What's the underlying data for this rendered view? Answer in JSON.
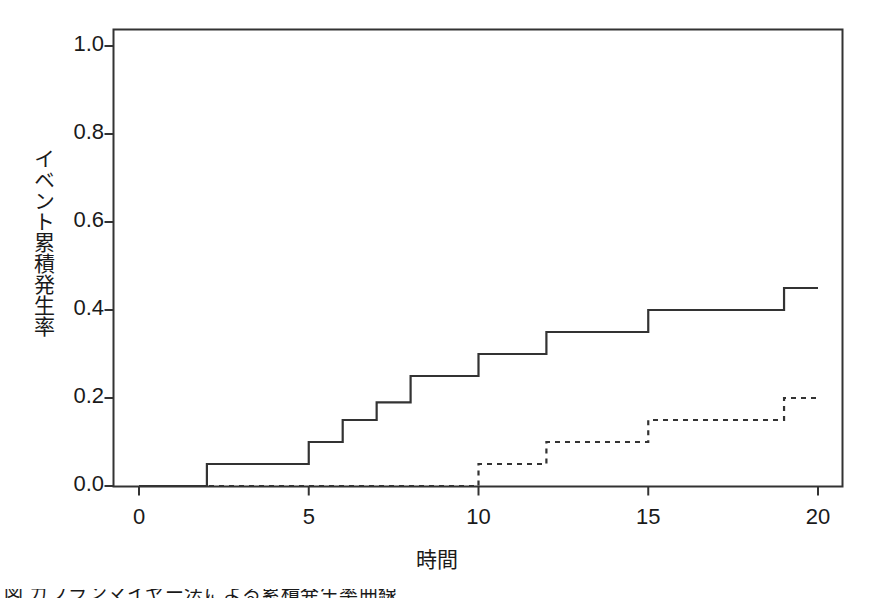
{
  "chart_data": {
    "type": "line",
    "title": "",
    "subtitle": "",
    "xlabel": "時間",
    "ylabel": "イベント累積発生率",
    "xlim": [
      0,
      20
    ],
    "ylim": [
      0.0,
      1.04
    ],
    "xticks": [
      "0",
      "5",
      "10",
      "15",
      "20"
    ],
    "xtick_values": [
      0,
      5,
      10,
      15,
      20
    ],
    "yticks": [
      "0.0",
      "0.2",
      "0.4",
      "0.6",
      "0.8",
      "1.0"
    ],
    "ytick_values": [
      0.0,
      0.2,
      0.4,
      0.6,
      0.8,
      1.0
    ],
    "grid": false,
    "legend": "none",
    "step_direction": "post",
    "line_color": "#333333",
    "background": "#ffffff",
    "series": [
      {
        "name": "solid-curve",
        "style": "solid",
        "color": "#333333",
        "x": [
          0,
          2,
          5,
          6,
          7,
          8,
          10,
          12,
          15,
          19,
          20
        ],
        "values": [
          0.0,
          0.05,
          0.1,
          0.15,
          0.19,
          0.25,
          0.3,
          0.35,
          0.4,
          0.45,
          0.45
        ]
      },
      {
        "name": "dashed-curve",
        "style": "dashed",
        "color": "#333333",
        "x": [
          0,
          10,
          12,
          15,
          19,
          20
        ],
        "values": [
          0.0,
          0.05,
          0.1,
          0.15,
          0.2,
          0.2
        ]
      }
    ]
  },
  "caption": {
    "text": "図 カプランマイヤー法による累積発生率曲線"
  }
}
